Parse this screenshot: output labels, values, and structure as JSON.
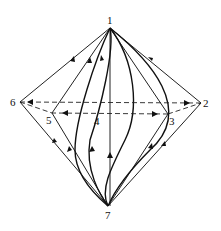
{
  "diagram": {
    "type": "graph",
    "nodes": [
      {
        "id": "1",
        "label": "1",
        "x": 110,
        "y": 28
      },
      {
        "id": "2",
        "label": "2",
        "x": 201,
        "y": 103
      },
      {
        "id": "3",
        "label": "3",
        "x": 168,
        "y": 114
      },
      {
        "id": "4",
        "label": "4",
        "x": 98,
        "y": 116
      },
      {
        "id": "5",
        "label": "5",
        "x": 52,
        "y": 113
      },
      {
        "id": "6",
        "label": "6",
        "x": 20,
        "y": 102
      },
      {
        "id": "7",
        "label": "7",
        "x": 108,
        "y": 206
      }
    ],
    "edges": [
      {
        "from": "1",
        "to": "6",
        "style": "solid"
      },
      {
        "from": "1",
        "to": "2",
        "style": "solid"
      },
      {
        "from": "6",
        "to": "7",
        "style": "solid"
      },
      {
        "from": "2",
        "to": "7",
        "style": "solid"
      },
      {
        "from": "1",
        "to": "5",
        "style": "solid"
      },
      {
        "from": "5",
        "to": "7",
        "style": "solid"
      },
      {
        "from": "1",
        "to": "3",
        "style": "solid"
      },
      {
        "from": "3",
        "to": "7",
        "style": "solid"
      },
      {
        "from": "1",
        "to": "7",
        "style": "solid",
        "shape": "vertical"
      },
      {
        "from": "1",
        "to": "7",
        "style": "solid",
        "shape": "curve-right"
      },
      {
        "from": "1",
        "to": "7",
        "style": "solid",
        "shape": "curve-left"
      },
      {
        "from": "1",
        "to": "7",
        "style": "solid",
        "shape": "s-curve"
      },
      {
        "from": "2",
        "to": "6",
        "style": "dashed"
      },
      {
        "from": "3",
        "to": "5",
        "style": "dashed"
      },
      {
        "from": "6",
        "to": "5",
        "style": "dashed"
      },
      {
        "from": "3",
        "to": "2",
        "style": "dashed"
      }
    ]
  }
}
